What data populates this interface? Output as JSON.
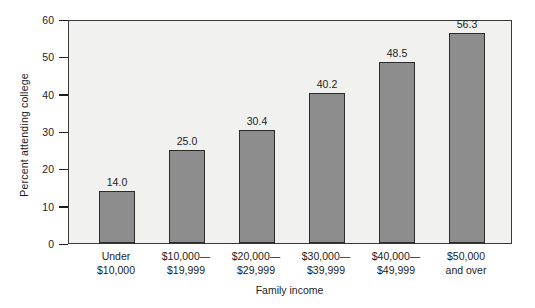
{
  "chart_data": {
    "type": "bar",
    "title": "",
    "subtitle": "",
    "xlabel": "Family income",
    "ylabel": "Percent attending college",
    "categories": [
      "Under\n$10,000",
      "$10,000—\n$19,999",
      "$20,000—\n$29,999",
      "$30,000—\n$39,999",
      "$40,000—\n$49,999",
      "$50,000\nand over"
    ],
    "category_lines": [
      [
        "Under",
        "$10,000"
      ],
      [
        "$10,000—",
        "$19,999"
      ],
      [
        "$20,000—",
        "$29,999"
      ],
      [
        "$30,000—",
        "$39,999"
      ],
      [
        "$40,000—",
        "$49,999"
      ],
      [
        "$50,000",
        "and over"
      ]
    ],
    "values": [
      14.0,
      25.0,
      30.4,
      40.2,
      48.5,
      56.3
    ],
    "value_labels": [
      "14.0",
      "25.0",
      "30.4",
      "40.2",
      "48.5",
      "56.3"
    ],
    "ylim": [
      0,
      60
    ],
    "yticks": [
      0,
      10,
      20,
      30,
      40,
      50,
      60
    ],
    "ytick_labels": [
      "0",
      "10",
      "20",
      "30",
      "40",
      "50",
      "60"
    ],
    "grid": false,
    "legend": null,
    "bar_color": "#8d8d8d",
    "bar_edge_color": "#2b2b2b",
    "plot_background": "#f1f1ef",
    "axis_color": "#3a3a3a",
    "text_color": "#1c1c1c"
  }
}
